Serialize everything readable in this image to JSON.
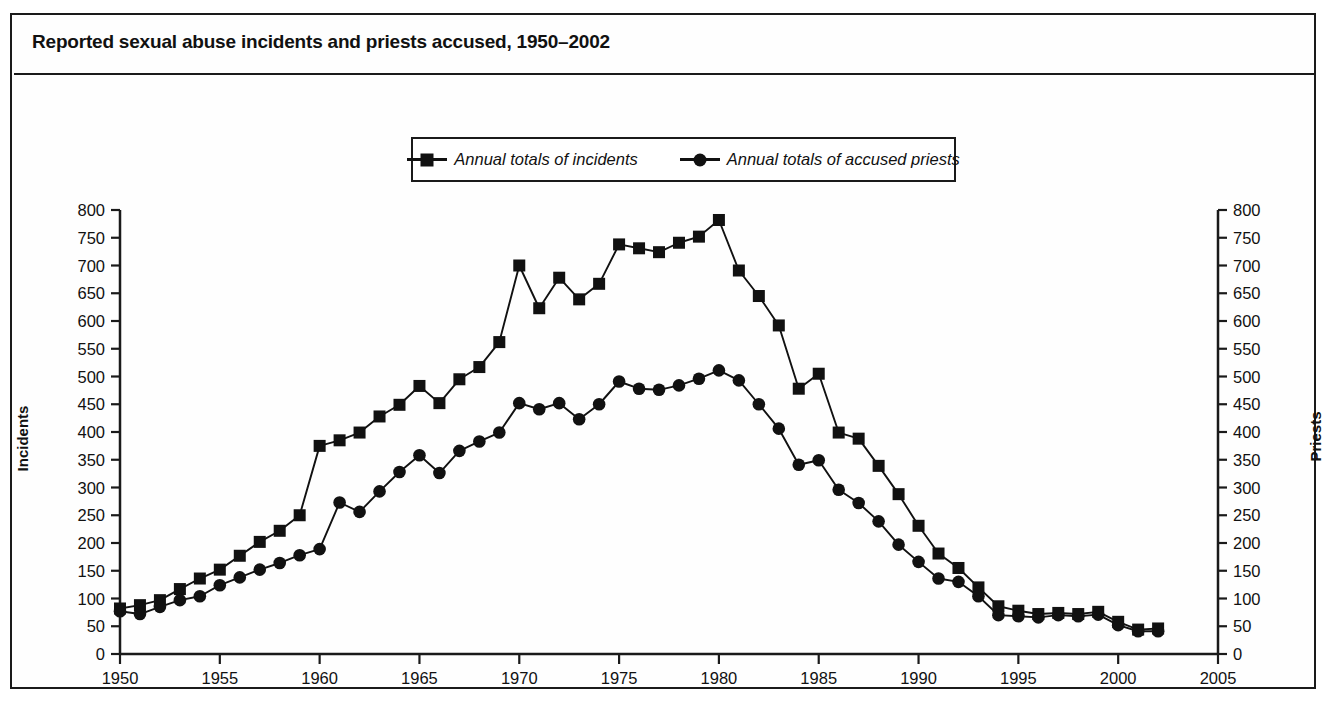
{
  "chart_data": {
    "type": "line",
    "title": "Reported sexual abuse incidents and priests accused, 1950–2002",
    "xlabel": "",
    "ylabel": "Incidents",
    "ylabel_right": "Priests",
    "xlim": [
      1950,
      2005
    ],
    "ylim": [
      0,
      800
    ],
    "y_ticks": [
      0,
      50,
      100,
      150,
      200,
      250,
      300,
      350,
      400,
      450,
      500,
      550,
      600,
      650,
      700,
      750,
      800
    ],
    "y_ticks_right": [
      0,
      50,
      100,
      150,
      200,
      250,
      300,
      350,
      400,
      450,
      500,
      550,
      600,
      650,
      700,
      750,
      800
    ],
    "x_ticks": [
      1950,
      1955,
      1960,
      1965,
      1970,
      1975,
      1980,
      1985,
      1990,
      1995,
      2000,
      2005
    ],
    "grid": false,
    "legend_position": "top-center",
    "x": [
      1950,
      1951,
      1952,
      1953,
      1954,
      1955,
      1956,
      1957,
      1958,
      1959,
      1960,
      1961,
      1962,
      1963,
      1964,
      1965,
      1966,
      1967,
      1968,
      1969,
      1970,
      1971,
      1972,
      1973,
      1974,
      1975,
      1976,
      1977,
      1978,
      1979,
      1980,
      1981,
      1982,
      1983,
      1984,
      1985,
      1986,
      1987,
      1988,
      1989,
      1990,
      1991,
      1992,
      1993,
      1994,
      1995,
      1996,
      1997,
      1998,
      1999,
      2000,
      2001,
      2002
    ],
    "series": [
      {
        "name": "Annual totals of incidents",
        "marker": "square",
        "color": "#111111",
        "axis": "left",
        "values": [
          82,
          88,
          97,
          117,
          136,
          152,
          177,
          202,
          222,
          250,
          375,
          385,
          399,
          428,
          449,
          483,
          452,
          495,
          517,
          562,
          700,
          623,
          678,
          639,
          667,
          738,
          731,
          724,
          741,
          752,
          782,
          691,
          645,
          592,
          478,
          505,
          399,
          388,
          339,
          288,
          231,
          181,
          155,
          120,
          86,
          78,
          72,
          74,
          72,
          76,
          58,
          44,
          46
        ]
      },
      {
        "name": "Annual totals of accused priests",
        "marker": "circle",
        "color": "#111111",
        "axis": "right",
        "values": [
          77,
          72,
          85,
          97,
          104,
          124,
          138,
          152,
          164,
          178,
          189,
          273,
          256,
          293,
          328,
          358,
          326,
          366,
          383,
          399,
          452,
          441,
          452,
          423,
          450,
          491,
          478,
          476,
          484,
          496,
          511,
          493,
          450,
          406,
          341,
          349,
          296,
          272,
          239,
          197,
          166,
          136,
          130,
          104,
          70,
          68,
          66,
          70,
          68,
          71,
          52,
          41,
          41
        ]
      }
    ]
  },
  "legend": {
    "items": [
      {
        "label": "Annual totals of incidents",
        "marker": "square"
      },
      {
        "label": "Annual totals of accused priests",
        "marker": "circle"
      }
    ]
  },
  "axes": {
    "left_title": "Incidents",
    "right_title": "Priests"
  }
}
